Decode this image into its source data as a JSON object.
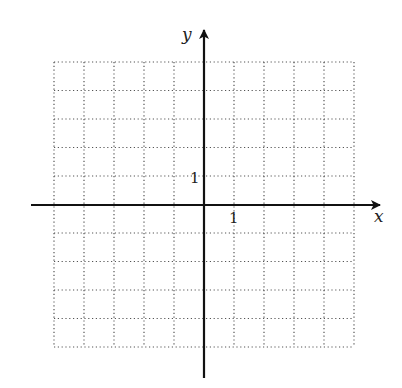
{
  "diagram": {
    "type": "coordinate-plane",
    "axes": {
      "x_label": "x",
      "y_label": "y",
      "x_tick_label": "1",
      "y_tick_label": "1"
    },
    "grid": {
      "columns": 10,
      "rows": 10,
      "x_range": [
        -5,
        5
      ],
      "y_range": [
        -5,
        5
      ],
      "line_style": "dotted",
      "line_color": "#555555"
    },
    "axis_color": "#111111",
    "background": "#ffffff"
  }
}
